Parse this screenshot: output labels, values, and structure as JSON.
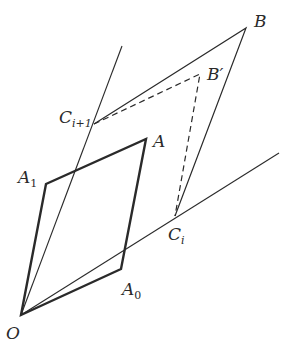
{
  "figure": {
    "colors": {
      "stroke": "#2a2a2a",
      "background": "#ffffff"
    },
    "points": {
      "O": {
        "x": 21,
        "y": 315
      },
      "A0": {
        "x": 121,
        "y": 269
      },
      "A": {
        "x": 146,
        "y": 139
      },
      "A1": {
        "x": 46,
        "y": 184
      },
      "Ci": {
        "x": 175,
        "y": 216
      },
      "Ci1": {
        "x": 94,
        "y": 124
      },
      "B": {
        "x": 246,
        "y": 28
      },
      "Bp": {
        "x": 200,
        "y": 74
      },
      "ray1_end": {
        "x": 122,
        "y": 46
      },
      "ray2_end": {
        "x": 279,
        "y": 153
      }
    },
    "labels": {
      "O": "O",
      "A": "A",
      "A0_base": "A",
      "A0_sub": "0",
      "A1_base": "A",
      "A1_sub": "1",
      "B": "B",
      "Bp": "B′",
      "Ci_base": "C",
      "Ci_sub": "i",
      "Ci1_base": "C",
      "Ci1_sub": "i+1"
    }
  }
}
